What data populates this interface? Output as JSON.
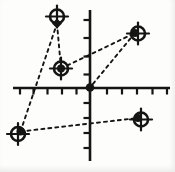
{
  "figure": {
    "width": 175,
    "height": 172,
    "ink_color": "#151515",
    "background_color": "#fdfdfb",
    "axes": {
      "x_axis": {
        "y": 88,
        "x1": 13,
        "x2": 170,
        "stroke_width": 2.6
      },
      "y_axis": {
        "x": 90,
        "y1": 10,
        "y2": 161,
        "stroke_width": 2.6
      },
      "x_ticks": [
        20,
        33.5,
        47.5,
        62,
        76.5,
        107,
        122,
        137,
        152.5,
        167
      ],
      "x_tick_length": 6.5,
      "x_tick_side": "below",
      "y_ticks": [
        20,
        38,
        56.5,
        74.5,
        103,
        118,
        133,
        148
      ],
      "y_tick_length": 6.5,
      "y_tick_side": "left",
      "tick_stroke_width": 2.2
    },
    "origin_dot": {
      "x": 90,
      "y": 87.5,
      "r": 4.3
    },
    "marker_style": {
      "circle_radius": 7,
      "circle_stroke_width": 2.6,
      "cross_half_length": 11,
      "cross_stroke_width": 2.2,
      "dot_radius": 4
    },
    "markers": [
      {
        "name": "target-top-left",
        "cx": 57,
        "cy": 16.5,
        "dot": {
          "x": 57,
          "y": 23.5,
          "shape": "diamond"
        }
      },
      {
        "name": "target-mid-left",
        "cx": 61,
        "cy": 68.5,
        "dot": {
          "x": 61,
          "y": 68.5,
          "shape": "circle"
        }
      },
      {
        "name": "target-top-right",
        "cx": 138,
        "cy": 33.5,
        "dot": {
          "x": 135,
          "y": 33,
          "shape": "circle"
        }
      },
      {
        "name": "target-bottom-left",
        "cx": 18,
        "cy": 134,
        "dot": {
          "x": 20.5,
          "y": 131.5,
          "shape": "circle"
        }
      },
      {
        "name": "target-bottom-right",
        "cx": 141,
        "cy": 119.5,
        "dot": {
          "x": 138,
          "y": 118,
          "shape": "circle"
        }
      }
    ],
    "dashed_segments": [
      {
        "from": [
          20.5,
          131.5
        ],
        "to": [
          57,
          23.5
        ]
      },
      {
        "from": [
          57,
          23.5
        ],
        "to": [
          61,
          68.5
        ]
      },
      {
        "from": [
          61,
          68.5
        ],
        "to": [
          135,
          33
        ]
      },
      {
        "from": [
          135,
          33
        ],
        "to": [
          90,
          87.5
        ]
      },
      {
        "from": [
          20.5,
          131.5
        ],
        "to": [
          138,
          118
        ]
      }
    ],
    "dash_style": {
      "stroke_width": 1.9,
      "dash_array": "3 4"
    }
  },
  "chart_data": {
    "type": "scatter",
    "title": "",
    "xlabel": "",
    "ylabel": "",
    "grid": false,
    "legend": "none",
    "axis_tick_labels_visible": false,
    "approx_unit_points": [
      {
        "x": -2,
        "y": 4
      },
      {
        "x": -2,
        "y": 1
      },
      {
        "x": 3,
        "y": 3
      },
      {
        "x": -5,
        "y": -3
      },
      {
        "x": 3,
        "y": -2
      },
      {
        "x": 0,
        "y": 0
      }
    ],
    "connections_between_points": [
      [
        [
          -5,
          -3
        ],
        [
          -2,
          4
        ]
      ],
      [
        [
          -2,
          4
        ],
        [
          -2,
          1
        ]
      ],
      [
        [
          -2,
          1
        ],
        [
          3,
          3
        ]
      ],
      [
        [
          3,
          3
        ],
        [
          0,
          0
        ]
      ],
      [
        [
          -5,
          -3
        ],
        [
          3,
          -2
        ]
      ]
    ],
    "marker_description": "circle-with-crosshair target symbols over filled dots, dashed connecting lines"
  }
}
